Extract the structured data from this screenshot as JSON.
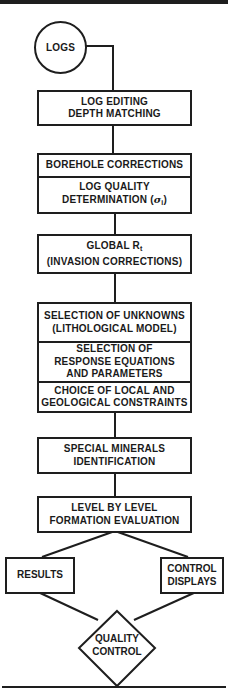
{
  "diagram": {
    "type": "flowchart",
    "start": {
      "label": "LOGS",
      "shape": "circle"
    },
    "steps": [
      {
        "id": "log-editing",
        "lines": [
          "LOG EDITING",
          "DEPTH MATCHING"
        ]
      },
      {
        "id": "corrections-group",
        "cells": [
          {
            "lines": [
              "BOREHOLE CORRECTIONS"
            ]
          },
          {
            "lines": [
              "LOG QUALITY",
              "DETERMINATION (σi)"
            ]
          }
        ]
      },
      {
        "id": "global-rt",
        "lines": [
          "GLOBAL Rt",
          "(INVASION CORRECTIONS)"
        ]
      },
      {
        "id": "model-group",
        "cells": [
          {
            "lines": [
              "SELECTION OF UNKNOWNS",
              "(LITHOLOGICAL MODEL)"
            ]
          },
          {
            "lines": [
              "SELECTION OF",
              "RESPONSE EQUATIONS",
              "AND PARAMETERS"
            ]
          },
          {
            "lines": [
              "CHOICE OF LOCAL AND",
              "GEOLOGICAL CONSTRAINTS"
            ]
          }
        ]
      },
      {
        "id": "special-minerals",
        "lines": [
          "SPECIAL MINERALS",
          "IDENTIFICATION"
        ]
      },
      {
        "id": "level-by-level",
        "lines": [
          "LEVEL BY LEVEL",
          "FORMATION EVALUATION"
        ]
      }
    ],
    "outputs": [
      {
        "id": "results",
        "label": "RESULTS"
      },
      {
        "id": "control-displays",
        "label": "CONTROL\nDISPLAYS"
      }
    ],
    "decision": {
      "label": "QUALITY\nCONTROL",
      "shape": "diamond"
    }
  },
  "text": {
    "logs": "LOGS",
    "box1": "LOG EDITING\nDEPTH MATCHING",
    "box2a": "BOREHOLE CORRECTIONS",
    "box2b_line1": "LOG QUALITY",
    "box2b_line2_prefix": "DETERMINATION (",
    "box2b_sigma": "σ",
    "box2b_sub": "i",
    "box2b_suffix": ")",
    "box3_prefix": "GLOBAL R",
    "box3_sub": "t",
    "box3_line2": "(INVASION CORRECTIONS)",
    "box4a": "SELECTION OF UNKNOWNS\n(LITHOLOGICAL MODEL)",
    "box4b": "SELECTION OF\nRESPONSE EQUATIONS\nAND PARAMETERS",
    "box4c": "CHOICE OF LOCAL AND\nGEOLOGICAL CONSTRAINTS",
    "box5": "SPECIAL MINERALS\nIDENTIFICATION",
    "box6": "LEVEL BY LEVEL\nFORMATION EVALUATION",
    "results": "RESULTS",
    "control_displays": "CONTROL\nDISPLAYS",
    "quality_control": "QUALITY\nCONTROL"
  },
  "colors": {
    "line": "#1e1e1e",
    "background": "#ffffff",
    "text": "#1a1a1a"
  }
}
